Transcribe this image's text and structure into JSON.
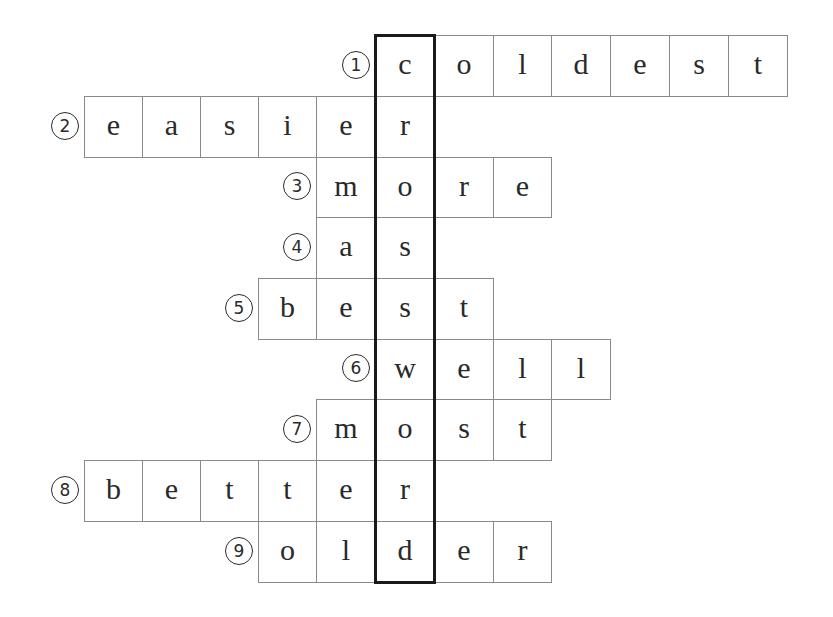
{
  "puzzle": {
    "type": "crossword",
    "highlight_column": 5,
    "hidden_word": "crossword",
    "colors": {
      "grid_line": "#8a8a8a",
      "highlight_border": "#1a1a1a",
      "text": "#2a2a2a",
      "background": "#ffffff"
    },
    "rows": [
      {
        "number": "1",
        "number_glyph": "①",
        "answer": "coldest",
        "start_col": 5,
        "letters": [
          "c",
          "o",
          "l",
          "d",
          "e",
          "s",
          "t"
        ]
      },
      {
        "number": "2",
        "number_glyph": "②",
        "answer": "easier",
        "start_col": 0,
        "letters": [
          "e",
          "a",
          "s",
          "i",
          "e",
          "r"
        ]
      },
      {
        "number": "3",
        "number_glyph": "③",
        "answer": "more",
        "start_col": 4,
        "letters": [
          "m",
          "o",
          "r",
          "e"
        ]
      },
      {
        "number": "4",
        "number_glyph": "④",
        "answer": "as",
        "start_col": 4,
        "letters": [
          "a",
          "s"
        ]
      },
      {
        "number": "5",
        "number_glyph": "⑤",
        "answer": "best",
        "start_col": 3,
        "letters": [
          "b",
          "e",
          "s",
          "t"
        ]
      },
      {
        "number": "6",
        "number_glyph": "⑥",
        "answer": "well",
        "start_col": 5,
        "letters": [
          "w",
          "e",
          "l",
          "l"
        ]
      },
      {
        "number": "7",
        "number_glyph": "⑦",
        "answer": "most",
        "start_col": 4,
        "letters": [
          "m",
          "o",
          "s",
          "t"
        ]
      },
      {
        "number": "8",
        "number_glyph": "⑧",
        "answer": "better",
        "start_col": 0,
        "letters": [
          "b",
          "e",
          "t",
          "t",
          "e",
          "r"
        ]
      },
      {
        "number": "9",
        "number_glyph": "⑨",
        "answer": "older",
        "start_col": 3,
        "letters": [
          "o",
          "l",
          "d",
          "e",
          "r"
        ]
      }
    ]
  }
}
